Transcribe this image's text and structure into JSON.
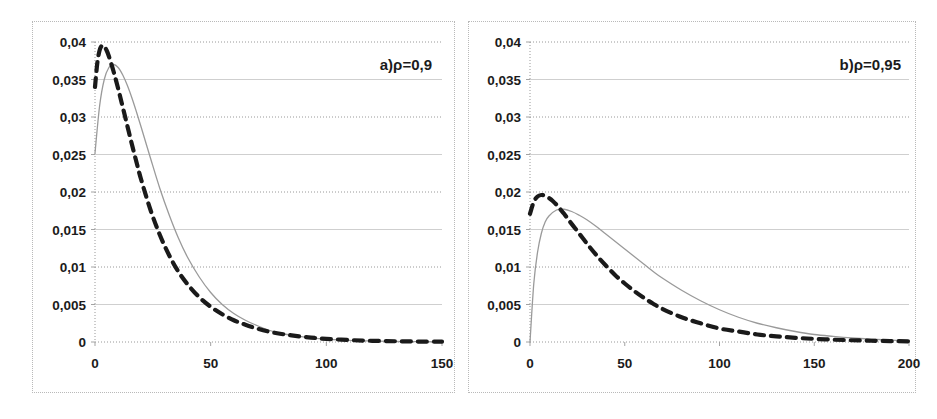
{
  "figure": {
    "panel_count": 2,
    "background_color": "#ffffff",
    "frame_color": "#b9b9b9",
    "gridline_dotted_color": "#8c8c8c",
    "gridline_solid_color": "#c9c9c9",
    "solid_series_color": "#9a9a9a",
    "dashed_series_color": "#1a1a1a"
  },
  "chart_data": [
    {
      "type": "line",
      "id": "panel-a",
      "title": "a)ρ=0,9",
      "annotation": "a)ρ=0,9",
      "xlabel": "",
      "ylabel": "",
      "xlim": [
        0,
        150
      ],
      "ylim": [
        0,
        0.04
      ],
      "xticks": [
        0,
        50,
        100,
        150
      ],
      "xtick_labels": [
        "0",
        "50",
        "100",
        "150"
      ],
      "yticks": [
        0,
        0.005,
        0.01,
        0.015,
        0.02,
        0.025,
        0.03,
        0.035,
        0.04
      ],
      "ytick_labels": [
        "0",
        "0,005",
        "0,01",
        "0,015",
        "0,02",
        "0,025",
        "0,03",
        "0,035",
        "0,04"
      ],
      "grid": true,
      "grid_style": "alternating dotted / solid horizontal lines",
      "legend": "none",
      "series": [
        {
          "name": "solid-curve",
          "style": "solid",
          "color": "#9a9a9a",
          "x": [
            0,
            2,
            4,
            6,
            8,
            10,
            12,
            14,
            16,
            18,
            20,
            24,
            28,
            32,
            36,
            40,
            45,
            50,
            55,
            60,
            65,
            70,
            75,
            80,
            85,
            90,
            95,
            100,
            110,
            120,
            130,
            140,
            150
          ],
          "values": [
            0.0252,
            0.0315,
            0.035,
            0.0366,
            0.037,
            0.0366,
            0.0356,
            0.0342,
            0.0325,
            0.0306,
            0.0286,
            0.0245,
            0.0205,
            0.017,
            0.0139,
            0.0113,
            0.0087,
            0.0066,
            0.005,
            0.0038,
            0.0029,
            0.0022,
            0.0016,
            0.0012,
            0.0009,
            0.00068,
            0.00051,
            0.00038,
            0.00021,
            0.00012,
            7e-05,
            4e-05,
            2e-05
          ]
        },
        {
          "name": "dashed-curve",
          "style": "dashed",
          "color": "#1a1a1a",
          "x": [
            0,
            1,
            2,
            3,
            4,
            5,
            6,
            8,
            10,
            12,
            14,
            16,
            18,
            20,
            24,
            28,
            32,
            36,
            40,
            45,
            50,
            55,
            60,
            65,
            70,
            75,
            80,
            85,
            90,
            95,
            100,
            110,
            120,
            130,
            140,
            150
          ],
          "values": [
            0.034,
            0.0372,
            0.0389,
            0.0395,
            0.0394,
            0.0389,
            0.0381,
            0.0361,
            0.0338,
            0.0313,
            0.0288,
            0.0263,
            0.0239,
            0.0216,
            0.0176,
            0.0143,
            0.0116,
            0.0094,
            0.0077,
            0.006,
            0.0047,
            0.0037,
            0.0029,
            0.0023,
            0.0018,
            0.0014,
            0.0011,
            0.00088,
            0.00069,
            0.00054,
            0.00042,
            0.00026,
            0.00016,
            0.0001,
            6e-05,
            4e-05
          ]
        }
      ]
    },
    {
      "type": "line",
      "id": "panel-b",
      "title": "b)ρ=0,95",
      "annotation": "b)ρ=0,95",
      "xlabel": "",
      "ylabel": "",
      "xlim": [
        0,
        200
      ],
      "ylim": [
        0,
        0.04
      ],
      "xticks": [
        0,
        50,
        100,
        150,
        200
      ],
      "xtick_labels": [
        "0",
        "50",
        "100",
        "150",
        "200"
      ],
      "yticks": [
        0,
        0.005,
        0.01,
        0.015,
        0.02,
        0.025,
        0.03,
        0.035,
        0.04
      ],
      "ytick_labels": [
        "0",
        "0,005",
        "0,01",
        "0,015",
        "0,02",
        "0,025",
        "0,03",
        "0,035",
        "0,04"
      ],
      "grid": true,
      "grid_style": "alternating dotted / solid horizontal lines",
      "legend": "none",
      "series": [
        {
          "name": "solid-curve",
          "style": "solid",
          "color": "#9a9a9a",
          "x": [
            0,
            2,
            4,
            6,
            8,
            10,
            14,
            18,
            22,
            26,
            30,
            35,
            40,
            45,
            50,
            55,
            60,
            65,
            70,
            80,
            90,
            100,
            110,
            120,
            130,
            140,
            150,
            160,
            170,
            180,
            190,
            200
          ],
          "values": [
            0.0,
            0.0078,
            0.012,
            0.0145,
            0.016,
            0.0168,
            0.0176,
            0.0177,
            0.0174,
            0.0169,
            0.0163,
            0.0154,
            0.0144,
            0.0134,
            0.0124,
            0.0114,
            0.0104,
            0.0094,
            0.0085,
            0.0069,
            0.0055,
            0.0043,
            0.0033,
            0.0025,
            0.0019,
            0.0014,
            0.001,
            0.00075,
            0.00054,
            0.00038,
            0.00026,
            0.00018
          ]
        },
        {
          "name": "dashed-curve",
          "style": "dashed",
          "color": "#1a1a1a",
          "x": [
            0,
            2,
            4,
            6,
            8,
            10,
            12,
            14,
            16,
            18,
            20,
            24,
            28,
            32,
            36,
            40,
            45,
            50,
            55,
            60,
            65,
            70,
            80,
            90,
            100,
            110,
            120,
            130,
            140,
            150,
            160,
            170,
            180,
            190,
            200
          ],
          "values": [
            0.0171,
            0.0187,
            0.0194,
            0.0196,
            0.0195,
            0.0192,
            0.0188,
            0.0183,
            0.0177,
            0.0171,
            0.0164,
            0.0151,
            0.0138,
            0.0125,
            0.0113,
            0.0102,
            0.0089,
            0.0078,
            0.0068,
            0.0059,
            0.0051,
            0.0044,
            0.0033,
            0.0025,
            0.0018,
            0.0014,
            0.001,
            0.00075,
            0.00056,
            0.00042,
            0.00031,
            0.00023,
            0.00017,
            0.00012,
            9e-05
          ]
        }
      ]
    }
  ]
}
